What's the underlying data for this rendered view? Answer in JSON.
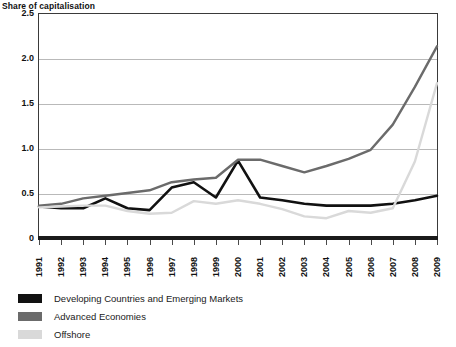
{
  "chart_data": {
    "type": "line",
    "title": "Share of capitalisation",
    "xlabel": "",
    "ylabel": "",
    "ylim": [
      0,
      2.5
    ],
    "yticks": [
      "0",
      "0.5",
      "1.0",
      "1.5",
      "2.0",
      "2.5"
    ],
    "ytick_values": [
      0,
      0.5,
      1.0,
      1.5,
      2.0,
      2.5
    ],
    "grid": true,
    "legend_position": "below",
    "categories": [
      "1991",
      "1992",
      "1993",
      "1994",
      "1995",
      "1996",
      "1997",
      "1998",
      "1999",
      "2000",
      "2001",
      "2002",
      "2003",
      "2004",
      "2005",
      "2006",
      "2007",
      "2008",
      "2009"
    ],
    "series": [
      {
        "name": "Developing Countries and Emerging Markets",
        "color": "#111111",
        "values": [
          0.35,
          0.33,
          0.33,
          0.44,
          0.33,
          0.31,
          0.56,
          0.62,
          0.45,
          0.86,
          0.45,
          0.42,
          0.38,
          0.36,
          0.36,
          0.36,
          0.38,
          0.42,
          0.47
        ]
      },
      {
        "name": "Advanced Economies",
        "color": "#6b6b6b",
        "values": [
          0.36,
          0.38,
          0.44,
          0.47,
          0.5,
          0.53,
          0.62,
          0.65,
          0.67,
          0.87,
          0.87,
          0.8,
          0.73,
          0.8,
          0.88,
          0.98,
          1.26,
          1.68,
          2.13
        ]
      },
      {
        "name": "Offshore",
        "color": "#d9d9d9",
        "values": [
          0.34,
          0.35,
          0.36,
          0.36,
          0.3,
          0.27,
          0.28,
          0.41,
          0.38,
          0.42,
          0.38,
          0.32,
          0.24,
          0.22,
          0.3,
          0.28,
          0.33,
          0.85,
          1.72
        ]
      }
    ]
  },
  "legend": {
    "items": [
      {
        "label": "Developing Countries and Emerging Markets",
        "color": "#111111"
      },
      {
        "label": "Advanced Economies",
        "color": "#6b6b6b"
      },
      {
        "label": "Offshore",
        "color": "#d9d9d9"
      }
    ]
  }
}
